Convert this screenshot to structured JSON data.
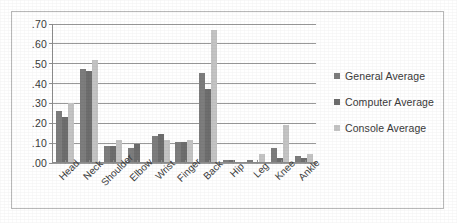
{
  "chart_data": {
    "type": "bar",
    "title": "",
    "xlabel": "",
    "ylabel": "",
    "ylim": [
      0,
      0.7
    ],
    "grid": true,
    "legend_position": "right",
    "y_ticks": [
      ".00",
      ".10",
      ".20",
      ".30",
      ".40",
      ".50",
      ".60",
      ".70"
    ],
    "y_tick_values": [
      0.0,
      0.1,
      0.2,
      0.3,
      0.4,
      0.5,
      0.6,
      0.7
    ],
    "categories": [
      "Head",
      "Neck",
      "Shoulder",
      "Elbow",
      "Wrist",
      "Finger",
      "Back",
      "Hip",
      "Leg",
      "Knee",
      "Ankle"
    ],
    "series": [
      {
        "name": "General Average",
        "color": "#7d7d7d",
        "values": [
          0.26,
          0.47,
          0.08,
          0.07,
          0.13,
          0.1,
          0.45,
          0.01,
          0.01,
          0.07,
          0.03
        ]
      },
      {
        "name": "Computer Average",
        "color": "#6e6e6e",
        "values": [
          0.23,
          0.46,
          0.08,
          0.09,
          0.14,
          0.1,
          0.37,
          0.01,
          0.0,
          0.02,
          0.02
        ]
      },
      {
        "name": "Console Average",
        "color": "#c4c4c4",
        "values": [
          0.3,
          0.52,
          0.11,
          0.0,
          0.11,
          0.11,
          0.67,
          0.0,
          0.04,
          0.19,
          0.04
        ]
      }
    ]
  }
}
